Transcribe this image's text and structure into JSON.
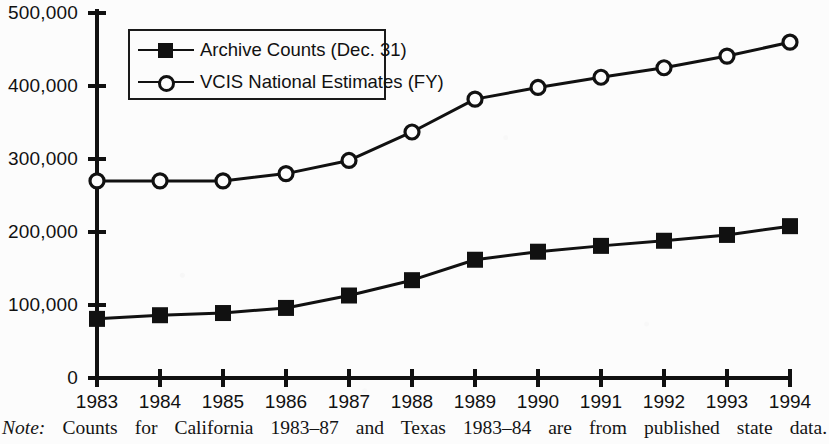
{
  "figure": {
    "background_color": "#fcfcfc",
    "ink_color": "#111111"
  },
  "note": {
    "label": "Note:",
    "body": "Counts for California 1983–87 and Texas 1983–84 are from published state data."
  },
  "legend": {
    "entries": [
      {
        "label": "Archive Counts (Dec. 31)",
        "marker": "filled-square",
        "color": "#111111"
      },
      {
        "label": "VCIS National Estimates (FY)",
        "marker": "open-circle",
        "color": "#111111"
      }
    ]
  },
  "axes": {
    "y_tick_labels": [
      "500,000",
      "400,000",
      "300,000",
      "200,000",
      "100,000",
      "0"
    ],
    "x_tick_labels": [
      "1983",
      "1984",
      "1985",
      "1986",
      "1987",
      "1988",
      "1989",
      "1990",
      "1991",
      "1992",
      "1993",
      "1994"
    ]
  },
  "chart_data": {
    "type": "line",
    "title": "",
    "subtitle": "",
    "xlabel": "",
    "ylabel": "",
    "xlim": [
      1983,
      1994
    ],
    "ylim": [
      0,
      500000
    ],
    "y_ticks": [
      0,
      100000,
      200000,
      300000,
      400000,
      500000
    ],
    "grid": false,
    "legend_position": "upper-left-inside",
    "x": [
      1983,
      1984,
      1985,
      1986,
      1987,
      1988,
      1989,
      1990,
      1991,
      1992,
      1993,
      1994
    ],
    "categories": [
      "1983",
      "1984",
      "1985",
      "1986",
      "1987",
      "1988",
      "1989",
      "1990",
      "1991",
      "1992",
      "1993",
      "1994"
    ],
    "series": [
      {
        "name": "VCIS National Estimates (FY)",
        "marker": "open-circle",
        "values": [
          270000,
          270000,
          270000,
          280000,
          298000,
          337000,
          382000,
          398000,
          412000,
          425000,
          441000,
          460000
        ]
      },
      {
        "name": "Archive Counts (Dec. 31)",
        "marker": "filled-square",
        "values": [
          81000,
          86000,
          89000,
          96000,
          113000,
          134000,
          162000,
          173000,
          181000,
          188000,
          196000,
          208000
        ]
      }
    ],
    "annotations": [
      "Note: Counts for California 1983–87 and Texas 1983–84 are from published state data."
    ]
  }
}
